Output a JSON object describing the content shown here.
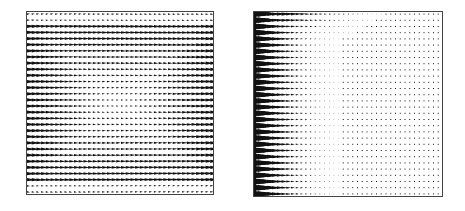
{
  "figure": {
    "background": "#ffffff",
    "ink": "#111111",
    "frame_color": "#444444"
  },
  "chart_data": [
    {
      "type": "quiver",
      "title": "",
      "xlabel": "",
      "ylabel": "",
      "grid": false,
      "legend": "none",
      "panel": "left",
      "bbox_px": [
        26,
        11,
        213,
        194
      ],
      "rows": 30,
      "cols": 40,
      "description": "Horizontal flow field: near-horizontal arrows in dense rows; arrows strongest near left/right walls, weakest in a central eye-shaped region with slight vertical deflection (rows converge toward center).",
      "flow_pattern": "symmetric-eye",
      "magnitude_max_at": "left and right edges",
      "magnitude_min_at": "center"
    },
    {
      "type": "quiver",
      "title": "",
      "xlabel": "",
      "ylabel": "",
      "grid": false,
      "legend": "none",
      "panel": "right",
      "bbox_px": [
        253,
        11,
        442,
        196
      ],
      "rows": 30,
      "cols": 40,
      "description": "Flow field with strong wedge-shaped arrows along the left wall decaying rapidly to small dots across the domain; a dense swirling region at the top-left corner.",
      "flow_pattern": "left-wall boundary layer with top-left corner vortex",
      "magnitude_max_at": "left wall / top-left corner",
      "magnitude_min_at": "interior and right side"
    }
  ]
}
